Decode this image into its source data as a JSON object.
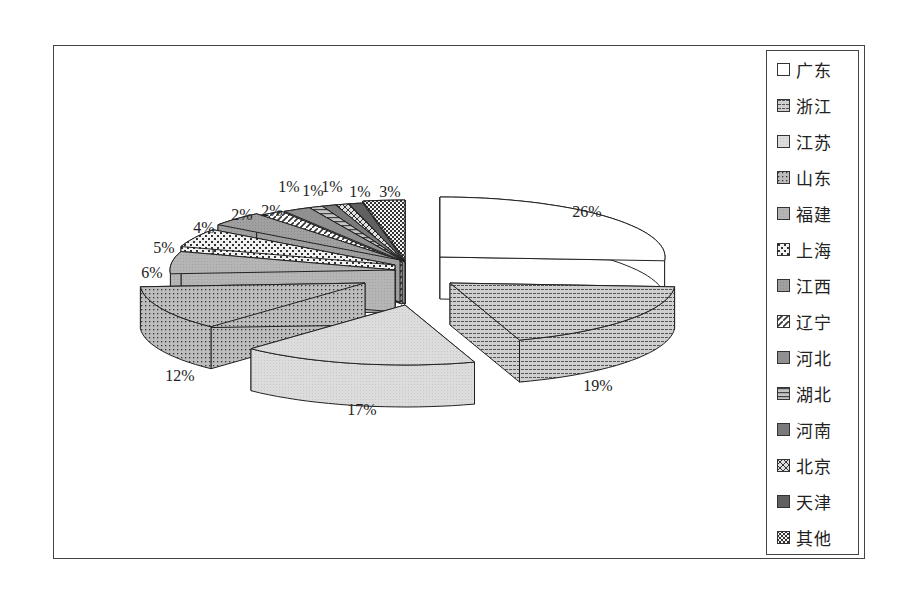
{
  "chart_data": {
    "type": "pie",
    "style": "3d-exploded",
    "title": "",
    "legend_position": "right",
    "categories": [
      "广东",
      "浙江",
      "江苏",
      "山东",
      "福建",
      "上海",
      "江西",
      "辽宁",
      "河北",
      "湖北",
      "河南",
      "北京",
      "天津",
      "其他"
    ],
    "values": [
      26,
      19,
      17,
      12,
      6,
      5,
      4,
      2,
      2,
      1,
      1,
      1,
      1,
      3
    ],
    "labels": [
      "26%",
      "19%",
      "17%",
      "12%",
      "6%",
      "5%",
      "4%",
      "2%",
      "2%",
      "1%",
      "1%",
      "1%",
      "1%",
      "3%"
    ],
    "value_unit": "%"
  },
  "legend": {
    "items": [
      {
        "label": "广东",
        "pattern": "white"
      },
      {
        "label": "浙江",
        "pattern": "hlines"
      },
      {
        "label": "江苏",
        "pattern": "lightgray"
      },
      {
        "label": "山东",
        "pattern": "dots"
      },
      {
        "label": "福建",
        "pattern": "gray"
      },
      {
        "label": "上海",
        "pattern": "bricks"
      },
      {
        "label": "江西",
        "pattern": "midgray"
      },
      {
        "label": "辽宁",
        "pattern": "diag"
      },
      {
        "label": "河北",
        "pattern": "gray2"
      },
      {
        "label": "湖北",
        "pattern": "hlines-dark"
      },
      {
        "label": "河南",
        "pattern": "darkgray"
      },
      {
        "label": "北京",
        "pattern": "diagcross"
      },
      {
        "label": "天津",
        "pattern": "darker"
      },
      {
        "label": "其他",
        "pattern": "checker"
      }
    ]
  },
  "colors": {
    "frame": "#444444",
    "slice_outline": "#222222"
  }
}
